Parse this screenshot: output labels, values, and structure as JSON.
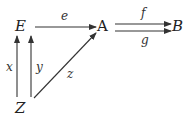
{
  "diagram": {
    "type": "commutative-diagram",
    "nodes": [
      {
        "id": "E",
        "label": "E"
      },
      {
        "id": "A",
        "label": "A"
      },
      {
        "id": "B",
        "label": "B"
      },
      {
        "id": "Z",
        "label": "Z"
      }
    ],
    "edges": [
      {
        "from": "E",
        "to": "A",
        "label": "e"
      },
      {
        "from": "A",
        "to": "B",
        "label": "f"
      },
      {
        "from": "A",
        "to": "B",
        "label": "g"
      },
      {
        "from": "Z",
        "to": "E",
        "label": "x"
      },
      {
        "from": "Z",
        "to": "E",
        "label": "y"
      },
      {
        "from": "Z",
        "to": "A",
        "label": "z"
      }
    ]
  }
}
